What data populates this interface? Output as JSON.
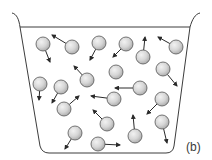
{
  "diagram": {
    "panel_label": "(b)",
    "colors": {
      "outline": "#3c3c3c",
      "molecule_fill_light": "#f2f2f2",
      "molecule_fill_dark": "#a8a8a8",
      "molecule_stroke": "#555555",
      "arrow": "#2a2a2a",
      "background": "#ffffff"
    },
    "container": {
      "rim_y": 27,
      "rim_left_x": 20,
      "rim_right_x": 190,
      "bottom_y": 153,
      "bottom_left_x": 45,
      "bottom_right_x": 170
    },
    "molecule_radius": 7,
    "molecules": [
      {
        "x": 43,
        "y": 44,
        "ax": 50,
        "ay": 62
      },
      {
        "x": 72,
        "y": 47,
        "ax": 52,
        "ay": 35
      },
      {
        "x": 99,
        "y": 43,
        "ax": 90,
        "ay": 60
      },
      {
        "x": 126,
        "y": 44,
        "ax": 113,
        "ay": 57
      },
      {
        "x": 143,
        "y": 57,
        "ax": 145,
        "ay": 37
      },
      {
        "x": 176,
        "y": 47,
        "ax": 158,
        "ay": 37
      },
      {
        "x": 116,
        "y": 72,
        "ax": null,
        "ay": null
      },
      {
        "x": 163,
        "y": 69,
        "ax": 177,
        "ay": 86
      },
      {
        "x": 40,
        "y": 84,
        "ax": 39,
        "ay": 100
      },
      {
        "x": 61,
        "y": 87,
        "ax": 52,
        "ay": 103
      },
      {
        "x": 87,
        "y": 80,
        "ax": 74,
        "ay": 66
      },
      {
        "x": 140,
        "y": 88,
        "ax": 115,
        "ay": 88
      },
      {
        "x": 64,
        "y": 109,
        "ax": 79,
        "ay": 96
      },
      {
        "x": 114,
        "y": 99,
        "ax": 91,
        "ay": 96
      },
      {
        "x": 162,
        "y": 99,
        "ax": 147,
        "ay": 114
      },
      {
        "x": 107,
        "y": 124,
        "ax": 93,
        "ay": 110
      },
      {
        "x": 135,
        "y": 136,
        "ax": 133,
        "ay": 115
      },
      {
        "x": 162,
        "y": 122,
        "ax": 167,
        "ay": 143
      },
      {
        "x": 75,
        "y": 133,
        "ax": 65,
        "ay": 149
      },
      {
        "x": 98,
        "y": 144,
        "ax": 120,
        "ay": 145
      }
    ]
  }
}
